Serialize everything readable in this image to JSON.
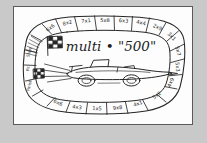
{
  "page": {
    "background_color": "#c9c9c9",
    "sheet_color": "#fdfdfd",
    "ink_color": "#262626"
  },
  "board": {
    "title": "multi • \"500\"",
    "kind": "hand-drawn multiplication race track board game",
    "start_label": "Start",
    "finish_label": "Finish",
    "pit_label": "Pit",
    "flag_icon": "checkered-flag-icon",
    "car_icon": "race-car-icon",
    "track_cells": [
      {
        "id": 1,
        "text": "6x6"
      },
      {
        "id": 2,
        "text": "8x2"
      },
      {
        "id": 3,
        "text": "7x1"
      },
      {
        "id": 4,
        "text": "5x8"
      },
      {
        "id": 5,
        "text": "6x3"
      },
      {
        "id": 6,
        "text": "4x4"
      },
      {
        "id": 7,
        "text": "2x9"
      },
      {
        "id": 8,
        "text": "3x1"
      },
      {
        "id": 9,
        "text": "5x7"
      },
      {
        "id": 10,
        "text": "5x3"
      },
      {
        "id": 11,
        "text": "4x9"
      },
      {
        "id": 12,
        "text": "5x2"
      },
      {
        "id": 13,
        "text": "4x1"
      },
      {
        "id": 14,
        "text": "9x8"
      },
      {
        "id": 15,
        "text": "1x5"
      },
      {
        "id": 16,
        "text": "4x3"
      },
      {
        "id": 17,
        "text": "6x6"
      },
      {
        "id": 18,
        "text": "Finish"
      },
      {
        "id": 19,
        "text": "Pit"
      },
      {
        "id": 20,
        "text": "Start"
      }
    ]
  }
}
